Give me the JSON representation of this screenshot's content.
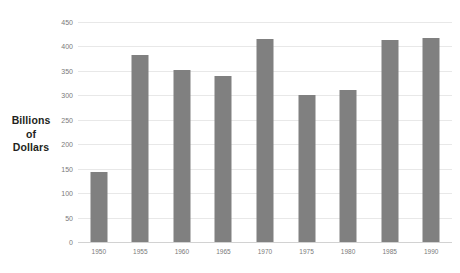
{
  "chart_data": {
    "type": "bar",
    "title": "",
    "subtitle": "",
    "xlabel": "",
    "ylabel": "Billions of Dollars",
    "ylabel_lines": [
      "Billions",
      "of",
      "Dollars"
    ],
    "categories": [
      "1950",
      "1955",
      "1960",
      "1965",
      "1970",
      "1975",
      "1980",
      "1985",
      "1990"
    ],
    "values": [
      144,
      382,
      351,
      340,
      415,
      300,
      311,
      414,
      418
    ],
    "series": [
      {
        "name": "Billions of Dollars",
        "values": [
          144,
          382,
          351,
          340,
          415,
          300,
          311,
          414,
          418
        ]
      }
    ],
    "ylim": [
      0,
      450
    ],
    "ytick_step": 50,
    "ytick_labels": [
      "0",
      "50",
      "100",
      "150",
      "200",
      "250",
      "300",
      "350",
      "400",
      "450"
    ],
    "ytick_values": [
      0,
      50,
      100,
      150,
      200,
      250,
      300,
      350,
      400,
      450
    ],
    "grid": true,
    "grid_axis": "y",
    "legend": false,
    "legend_position": "none",
    "bar_color": "#808080",
    "gridline_color": "#e8e8e8",
    "axis_color": "#d2d2d2",
    "tick_label_color": "#7a7a7a",
    "background_color": "#ffffff",
    "annotations": []
  }
}
